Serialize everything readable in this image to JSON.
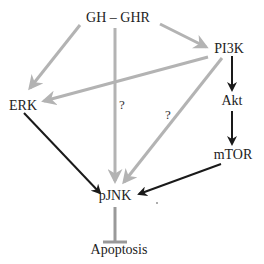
{
  "diagram": {
    "title": "",
    "colors": {
      "background": "#ffffff",
      "text": "#222222",
      "gray_edge": "#b3b3b3",
      "black_edge": "#1a1a1a"
    },
    "nodes": {
      "gh_ghr": {
        "label": "GH – GHR",
        "x": 118,
        "y": 22
      },
      "pi3k": {
        "label": "PI3K",
        "x": 229,
        "y": 53
      },
      "erk": {
        "label": "ERK",
        "x": 23,
        "y": 110
      },
      "akt": {
        "label": "Akt",
        "x": 232,
        "y": 105
      },
      "mtor": {
        "label": "mTOR",
        "x": 233,
        "y": 159
      },
      "pjnk": {
        "label": "pJNK",
        "x": 115,
        "y": 200
      },
      "apoptosis": {
        "label": "Apoptosis",
        "x": 119,
        "y": 254
      }
    },
    "question_marks": [
      {
        "label": "?",
        "x": 122,
        "y": 109
      },
      {
        "label": "?",
        "x": 168,
        "y": 119
      }
    ],
    "edges": [
      {
        "from": "gh_ghr",
        "to": "erk",
        "type": "activation",
        "color": "gray"
      },
      {
        "from": "gh_ghr",
        "to": "pjnk",
        "type": "activation",
        "color": "gray",
        "label": "?"
      },
      {
        "from": "gh_ghr",
        "to": "pi3k",
        "type": "activation",
        "color": "gray"
      },
      {
        "from": "pi3k",
        "to": "erk",
        "type": "activation",
        "color": "gray"
      },
      {
        "from": "pi3k",
        "to": "pjnk",
        "type": "activation",
        "color": "gray",
        "label": "?"
      },
      {
        "from": "pi3k",
        "to": "akt",
        "type": "activation",
        "color": "black"
      },
      {
        "from": "akt",
        "to": "mtor",
        "type": "activation",
        "color": "black"
      },
      {
        "from": "erk",
        "to": "pjnk",
        "type": "activation",
        "color": "black"
      },
      {
        "from": "mtor",
        "to": "pjnk",
        "type": "activation",
        "color": "black"
      },
      {
        "from": "pjnk",
        "to": "apoptosis",
        "type": "inhibition",
        "color": "gray"
      }
    ]
  }
}
